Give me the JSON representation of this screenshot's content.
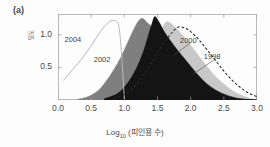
{
  "figure": {
    "panel_label": "(a)",
    "xlabel_prefix": "Log",
    "xlabel_sub": "10",
    "xlabel_suffix": " (피인용 수)",
    "ylabel": "밀도"
  },
  "chart_data": {
    "type": "area",
    "title": "",
    "xlabel": "Log10 (피인용 수)",
    "ylabel": "밀도",
    "xlim": [
      0.0,
      3.0
    ],
    "ylim": [
      0.0,
      1.32
    ],
    "grid": false,
    "legend": "inline-annotations",
    "xticks": [
      "0.0",
      "0.5",
      "1.0",
      "1.5",
      "2.0",
      "2.5",
      "3.0"
    ],
    "xtick_values": [
      0.0,
      0.5,
      1.0,
      1.5,
      2.0,
      2.5,
      3.0
    ],
    "yticks": [
      "0.5",
      "1.0"
    ],
    "ytick_values": [
      0.5,
      1.0
    ],
    "annotations": [
      {
        "text": "2004",
        "x": 0.28,
        "y": 0.92
      },
      {
        "text": "2002",
        "x": 0.72,
        "y": 0.62
      },
      {
        "text": "2000",
        "x": 2.02,
        "y": 0.9
      },
      {
        "text": "1998",
        "x": 2.38,
        "y": 0.66
      }
    ],
    "series": [
      {
        "name": "2004",
        "style": "line",
        "color": "#b9b9b9",
        "fill": "none",
        "peak_x": 0.85,
        "peak_y": 1.22,
        "x": [
          0.08,
          0.15,
          0.22,
          0.3,
          0.38,
          0.45,
          0.52,
          0.58,
          0.64,
          0.7,
          0.76,
          0.8,
          0.84,
          0.88,
          0.92,
          0.96,
          1.0
        ],
        "values": [
          0.3,
          0.38,
          0.47,
          0.56,
          0.66,
          0.76,
          0.86,
          0.96,
          1.05,
          1.13,
          1.19,
          1.22,
          1.22,
          1.21,
          1.12,
          0.68,
          0.02
        ]
      },
      {
        "name": "2002",
        "style": "filled",
        "color": "#7f7f7f",
        "fill": "#7f7f7f",
        "peak_x": 1.25,
        "peak_y": 1.25,
        "x": [
          0.3,
          0.45,
          0.6,
          0.72,
          0.84,
          0.95,
          1.05,
          1.14,
          1.22,
          1.28,
          1.35,
          1.42,
          1.5,
          1.6,
          1.72,
          1.85,
          2.0,
          2.15,
          2.3,
          2.45,
          2.6,
          2.8,
          3.0
        ],
        "values": [
          0.01,
          0.05,
          0.14,
          0.28,
          0.46,
          0.66,
          0.88,
          1.08,
          1.22,
          1.25,
          1.18,
          1.12,
          1.02,
          0.86,
          0.68,
          0.5,
          0.33,
          0.2,
          0.11,
          0.06,
          0.03,
          0.01,
          0.0
        ]
      },
      {
        "name": "2000",
        "style": "filled",
        "color": "#141414",
        "fill": "#141414",
        "peak_x": 1.45,
        "peak_y": 1.28,
        "x": [
          0.7,
          0.9,
          1.05,
          1.18,
          1.28,
          1.36,
          1.42,
          1.46,
          1.52,
          1.6,
          1.7,
          1.82,
          1.95,
          2.08,
          2.22,
          2.38,
          2.55,
          2.75,
          3.0
        ],
        "values": [
          0.02,
          0.1,
          0.26,
          0.48,
          0.72,
          0.98,
          1.18,
          1.28,
          1.2,
          1.05,
          0.9,
          0.74,
          0.58,
          0.42,
          0.27,
          0.15,
          0.07,
          0.02,
          0.0
        ]
      },
      {
        "name": "1998-fill",
        "style": "filled",
        "color": "#c8c8c8",
        "fill": "#c8c8c8",
        "peak_x": 1.62,
        "peak_y": 1.2,
        "x": [
          0.8,
          1.0,
          1.15,
          1.28,
          1.4,
          1.5,
          1.58,
          1.64,
          1.72,
          1.82,
          1.94,
          2.06,
          2.18,
          2.32,
          2.48,
          2.65,
          2.85,
          3.0
        ],
        "values": [
          0.01,
          0.08,
          0.22,
          0.44,
          0.7,
          0.95,
          1.12,
          1.2,
          1.16,
          1.06,
          0.92,
          0.76,
          0.6,
          0.42,
          0.26,
          0.13,
          0.04,
          0.0
        ]
      },
      {
        "name": "1998",
        "style": "dashed",
        "color": "#2a2a2a",
        "fill": "none",
        "peak_x": 1.8,
        "peak_y": 1.12,
        "x": [
          0.85,
          1.05,
          1.2,
          1.34,
          1.46,
          1.56,
          1.66,
          1.74,
          1.82,
          1.9,
          2.0,
          2.12,
          2.24,
          2.38,
          2.52,
          2.68,
          2.85,
          3.0
        ],
        "values": [
          0.02,
          0.12,
          0.26,
          0.46,
          0.66,
          0.82,
          0.96,
          1.06,
          1.12,
          1.11,
          1.05,
          0.93,
          0.78,
          0.6,
          0.42,
          0.25,
          0.12,
          0.05
        ]
      }
    ]
  }
}
